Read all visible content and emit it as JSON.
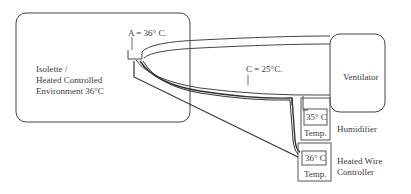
{
  "isolette": {
    "line1": "Isolette /",
    "line2": "Heated Controlled",
    "line3": "Environment 36°C"
  },
  "point_a": "A = 36° C.",
  "point_c": "C = 25°C.",
  "ventilator": "Ventilator",
  "humidifier": {
    "temp_value": "35° C",
    "temp_label": "Temp.",
    "name": "Humidifier"
  },
  "heated_wire": {
    "temp_value": "36° C",
    "temp_label": "Temp.",
    "name_line1": "Heated Wire",
    "name_line2": "Controller"
  }
}
